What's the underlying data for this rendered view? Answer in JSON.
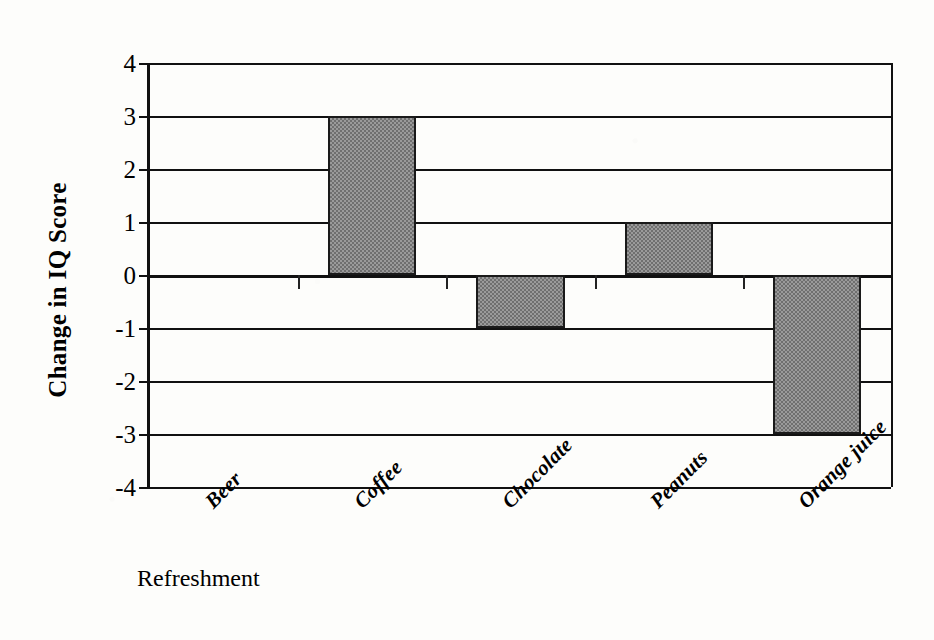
{
  "chart_data": {
    "type": "bar",
    "title": "",
    "subtitle": "",
    "xlabel": "Refreshment",
    "ylabel": "Change in IQ Score",
    "categories": [
      "Beer",
      "Coffee",
      "Chocolate",
      "Peanuts",
      "Orange juice"
    ],
    "values": [
      0,
      3,
      -1,
      1,
      -3
    ],
    "ylim": [
      -4,
      4
    ],
    "ytick_labels": [
      "4",
      "3",
      "2",
      "1",
      "0",
      "-1",
      "-2",
      "-3",
      "-4"
    ],
    "ytick_values": [
      4,
      3,
      2,
      1,
      0,
      -1,
      -2,
      -3,
      -4
    ],
    "grid": true,
    "grid_orientation": "horizontal",
    "legend": false,
    "legend_position": "none",
    "annotations": [],
    "series": [
      {
        "name": "Change in IQ Score",
        "values": [
          0,
          3,
          -1,
          1,
          -3
        ],
        "fill": "#9a9a9a",
        "pattern": "50-percent-gray-dither",
        "border_color": "#1a1a1a"
      }
    ],
    "colors": {
      "bar_fill": "#9a9a9a",
      "bar_pattern_dark": "#6f6f6f",
      "bar_border": "#1a1a1a",
      "axis": "#111111",
      "gridline": "#111111",
      "background": "#fdfdfb",
      "text": "#000000"
    },
    "x_label_rotation_deg": -45
  }
}
